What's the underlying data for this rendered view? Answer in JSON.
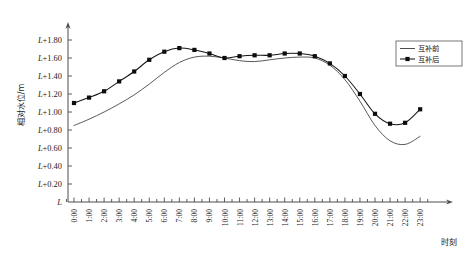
{
  "chart_data": {
    "type": "line",
    "title": "",
    "xlabel": "时刻",
    "ylabel": "相对水位/m",
    "grid": false,
    "legend_position": "top-right",
    "x": [
      "0:00",
      "1:00",
      "2:00",
      "3:00",
      "4:00",
      "5:00",
      "6:00",
      "7:00",
      "8:00",
      "9:00",
      "10:00",
      "11:00",
      "12:00",
      "13:00",
      "14:00",
      "15:00",
      "16:00",
      "17:00",
      "18:00",
      "19:00",
      "20:00",
      "21:00",
      "22:00",
      "23:00"
    ],
    "xlim": [
      0,
      23
    ],
    "ylim": [
      0,
      1.9
    ],
    "ytick_labels": [
      "L",
      "L+0.20",
      "L+0.40",
      "L+0.60",
      "L+0.80",
      "L+1.00",
      "L+1.20",
      "L+1.40",
      "L+1.60",
      "L+1.80"
    ],
    "ytick_values": [
      0,
      0.2,
      0.4,
      0.6,
      0.8,
      1.0,
      1.2,
      1.4,
      1.6,
      1.8
    ],
    "y_axis_base_label": "L",
    "y_axis_unit": "m",
    "series": [
      {
        "name": "互补前",
        "style": "line",
        "marker": "none",
        "color": "#3a3a3a",
        "values": [
          0.85,
          0.92,
          1.0,
          1.09,
          1.19,
          1.31,
          1.44,
          1.55,
          1.61,
          1.62,
          1.6,
          1.57,
          1.56,
          1.58,
          1.6,
          1.61,
          1.6,
          1.52,
          1.36,
          1.12,
          0.85,
          0.68,
          0.64,
          0.73
        ]
      },
      {
        "name": "互补后",
        "style": "line-marker",
        "marker": "square",
        "color": "#151515",
        "values": [
          1.1,
          1.16,
          1.23,
          1.34,
          1.45,
          1.58,
          1.67,
          1.71,
          1.69,
          1.65,
          1.6,
          1.62,
          1.63,
          1.63,
          1.65,
          1.65,
          1.62,
          1.54,
          1.4,
          1.2,
          0.98,
          0.87,
          0.88,
          1.03
        ]
      }
    ]
  },
  "legend": {
    "items": [
      {
        "label": "互补前",
        "type": "line"
      },
      {
        "label": "互补后",
        "type": "line-marker"
      }
    ]
  },
  "caption": {
    "text": ""
  }
}
